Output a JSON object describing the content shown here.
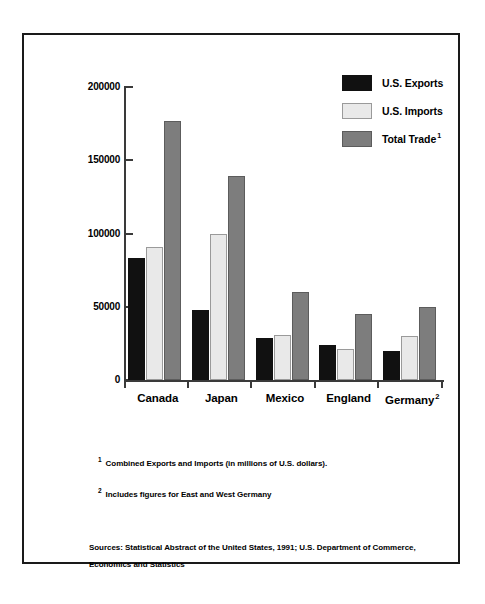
{
  "chart_data": {
    "type": "bar",
    "title": "",
    "subtitle": "",
    "xlabel": "",
    "ylabel": "",
    "ylim": [
      0,
      200000
    ],
    "yticks": [
      0,
      50000,
      100000,
      150000,
      200000
    ],
    "ytick_labels": [
      "0",
      "50000",
      "100000",
      "150000",
      "200000"
    ],
    "grid": false,
    "legend_position": "top-right",
    "categories": [
      "Canada",
      "Japan",
      "Mexico",
      "England",
      "Germany"
    ],
    "category_labels": [
      "Canada",
      "Japan",
      "Mexico",
      "England",
      "Germany"
    ],
    "category_footnote_markers": [
      "",
      "",
      "",
      "",
      "2"
    ],
    "series": [
      {
        "name": "U.S. Exports",
        "color": "#111111",
        "footnote_marker": "",
        "values": [
          83000,
          48000,
          29000,
          24000,
          20000
        ]
      },
      {
        "name": "U.S. Imports",
        "color": "#e9e9e9",
        "footnote_marker": "",
        "values": [
          91000,
          100000,
          31000,
          21000,
          30000
        ]
      },
      {
        "name": "Total Trade",
        "color": "#7d7d7d",
        "footnote_marker": "1",
        "values": [
          177000,
          139000,
          60000,
          45000,
          50000
        ]
      }
    ],
    "annotations": [
      "1 Combined Exports and Imports (in millions of U.S. dollars).",
      "2 Includes figures for East and West Germany"
    ]
  },
  "legend": {
    "items": [
      {
        "label": "U.S. Exports",
        "marker": "",
        "swatch": "#111111"
      },
      {
        "label": "U.S. Imports",
        "marker": "",
        "swatch": "#e9e9e9"
      },
      {
        "label": "Total Trade",
        "marker": "1",
        "swatch": "#7d7d7d"
      }
    ]
  },
  "footnotes": [
    {
      "marker": "1",
      "text": "Combined Exports and Imports (in millions of U.S. dollars)."
    },
    {
      "marker": "2",
      "text": "Includes figures for East and West Germany"
    }
  ],
  "sources": {
    "line1": "Sources:  Statistical Abstract of the United States, 1991; U.S. Department of Commerce,",
    "line2": "Economics and Statistics"
  }
}
